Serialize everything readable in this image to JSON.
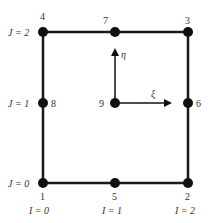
{
  "diagram": {
    "type": "quadratic-element-node-numbering",
    "colors": {
      "line": "#1a1a1a",
      "node": "#111111",
      "text": "#333333"
    },
    "nodes": [
      {
        "id": "1",
        "x": 43,
        "y": 183
      },
      {
        "id": "2",
        "x": 188,
        "y": 183
      },
      {
        "id": "3",
        "x": 188,
        "y": 32
      },
      {
        "id": "4",
        "x": 43,
        "y": 32
      },
      {
        "id": "5",
        "x": 115,
        "y": 183
      },
      {
        "id": "6",
        "x": 188,
        "y": 103
      },
      {
        "id": "7",
        "x": 115,
        "y": 32
      },
      {
        "id": "8",
        "x": 43,
        "y": 103
      },
      {
        "id": "9",
        "x": 115,
        "y": 103
      }
    ],
    "node_labels": {
      "n1": "1",
      "n2": "2",
      "n3": "3",
      "n4": "4",
      "n5": "5",
      "n6": "6",
      "n7": "7",
      "n8": "8",
      "n9": "9"
    },
    "row_labels": {
      "j0": "J = 0",
      "j1": "J = 1",
      "j2": "J = 2"
    },
    "col_labels": {
      "i0": "I = 0",
      "i1": "I = 1",
      "i2": "I = 2"
    },
    "axes": {
      "xi": "ξ",
      "eta": "η"
    }
  }
}
